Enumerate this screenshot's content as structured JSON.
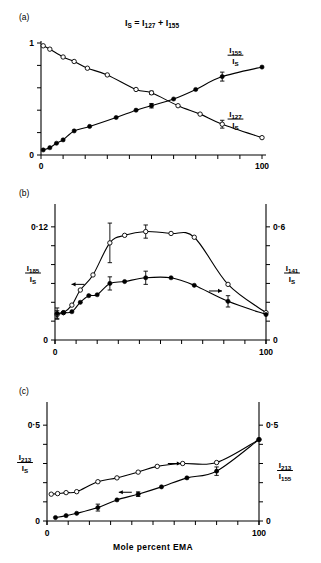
{
  "figure": {
    "title_equation": {
      "parts": [
        {
          "text": "I",
          "sub": "S"
        },
        {
          "text": " = ",
          "sub": ""
        },
        {
          "text": "I",
          "sub": "127"
        },
        {
          "text": " + ",
          "sub": ""
        },
        {
          "text": "I",
          "sub": "155"
        }
      ],
      "plain": "I_S = I_127 + I_155"
    },
    "xlabel": "Mole percent EMA",
    "panels": [
      "(a)",
      "(b)",
      "(c)"
    ]
  },
  "chart_data": [
    {
      "panel": "(a)",
      "type": "scatter",
      "title": "I_S = I_127 + I_155",
      "xlabel": "",
      "ylabel": "",
      "xlim": [
        0,
        100
      ],
      "ylim": [
        0,
        1
      ],
      "xticks": [
        0,
        10,
        20,
        30,
        40,
        50,
        60,
        70,
        80,
        90,
        100
      ],
      "xticklabels": [
        "0",
        "",
        "",
        "",
        "",
        "",
        "",
        "",
        "",
        "",
        "100"
      ],
      "yticks": [
        0,
        0.2,
        0.4,
        0.6,
        0.8,
        1.0
      ],
      "yticklabels": [
        "0",
        "",
        "",
        "",
        "",
        "1"
      ],
      "grid": false,
      "series": [
        {
          "name": "I_155 / I_S",
          "label_num": "155",
          "label_den": "S",
          "marker": "filled-circle",
          "x": [
            1,
            4,
            7,
            10,
            15,
            22,
            34,
            43,
            50,
            60,
            70,
            82,
            100
          ],
          "values": [
            0.045,
            0.065,
            0.105,
            0.135,
            0.215,
            0.255,
            0.335,
            0.4,
            0.44,
            0.5,
            0.585,
            0.7,
            0.785
          ],
          "errors": [
            0,
            0,
            0,
            0,
            0,
            0,
            0,
            0,
            0.02,
            0,
            0,
            0.04,
            0
          ],
          "label_xy": [
            88,
            0.9
          ]
        },
        {
          "name": "I_127 / I_S",
          "label_num": "127",
          "label_den": "S",
          "marker": "open-circle",
          "x": [
            1,
            4,
            10,
            15,
            21,
            30,
            43,
            50,
            62,
            72,
            82,
            100
          ],
          "values": [
            0.975,
            0.945,
            0.875,
            0.835,
            0.775,
            0.715,
            0.585,
            0.555,
            0.44,
            0.365,
            0.275,
            0.155
          ],
          "errors": [
            0,
            0,
            0,
            0,
            0,
            0,
            0,
            0.015,
            0,
            0,
            0.035,
            0
          ],
          "label_xy": [
            88,
            0.33
          ]
        }
      ]
    },
    {
      "panel": "(b)",
      "type": "scatter",
      "xlabel": "",
      "xlim": [
        0,
        100
      ],
      "xticks": [
        0,
        10,
        20,
        30,
        40,
        50,
        60,
        70,
        80,
        90,
        100
      ],
      "xticklabels": [
        "0",
        "",
        "",
        "",
        "",
        "",
        "",
        "",
        "",
        "",
        "100"
      ],
      "left_axis": {
        "label_num": "185",
        "label_den": "S",
        "lim": [
          0,
          0.14
        ],
        "ticks": [
          0,
          0.02,
          0.04,
          0.06,
          0.08,
          0.1,
          0.12
        ],
        "ticklabels": [
          "0",
          "",
          "",
          "",
          "",
          "",
          "0·12"
        ]
      },
      "right_axis": {
        "label_num": "141",
        "label_den": "S",
        "lim": [
          0,
          0.7
        ],
        "ticks": [
          0,
          0.1,
          0.2,
          0.3,
          0.4,
          0.5,
          0.6
        ],
        "ticklabels": [
          "0",
          "",
          "",
          "",
          "",
          "",
          "0·6"
        ]
      },
      "grid": false,
      "series": [
        {
          "name": "I_141 / I_S",
          "axis": "right",
          "marker": "open-circle",
          "arrow": "left",
          "arrow_xy": [
            14,
            0.295
          ],
          "x": [
            1,
            4,
            8,
            12,
            18,
            26,
            33,
            43,
            55,
            66,
            82,
            100
          ],
          "values": [
            0.135,
            0.145,
            0.185,
            0.265,
            0.345,
            0.515,
            0.555,
            0.575,
            0.565,
            0.545,
            0.295,
            0.145
          ],
          "errors": [
            0.02,
            0,
            0,
            0,
            0,
            0.105,
            0,
            0.035,
            0,
            0,
            0,
            0
          ]
        },
        {
          "name": "I_185 / I_S",
          "axis": "left",
          "marker": "filled-circle",
          "arrow": "right",
          "arrow_xy": [
            73,
            0.052
          ],
          "x": [
            1,
            4,
            8,
            12,
            16,
            20,
            26,
            33,
            43,
            55,
            66,
            82,
            100
          ],
          "values": [
            0.028,
            0.029,
            0.03,
            0.04,
            0.047,
            0.048,
            0.06,
            0.062,
            0.066,
            0.066,
            0.058,
            0.041,
            0.027
          ],
          "errors": [
            0.006,
            0,
            0,
            0,
            0,
            0,
            0.007,
            0,
            0.007,
            0,
            0,
            0.006,
            0
          ]
        }
      ]
    },
    {
      "panel": "(c)",
      "type": "scatter",
      "xlabel": "Mole percent EMA",
      "xlim": [
        0,
        100
      ],
      "xticks": [
        0,
        10,
        20,
        30,
        40,
        50,
        60,
        70,
        80,
        90,
        100
      ],
      "xticklabels": [
        "0",
        "",
        "",
        "",
        "",
        "",
        "",
        "",
        "",
        "",
        "100"
      ],
      "left_axis": {
        "label_num": "213",
        "label_den": "S",
        "lim": [
          0,
          0.6
        ],
        "ticks": [
          0,
          0.1,
          0.2,
          0.3,
          0.4,
          0.5
        ],
        "ticklabels": [
          "0",
          "",
          "",
          "",
          "",
          "0·5"
        ]
      },
      "right_axis": {
        "label_num": "213",
        "label_den": "155",
        "lim": [
          0,
          0.6
        ],
        "ticks": [
          0,
          0.1,
          0.2,
          0.3,
          0.4,
          0.5
        ],
        "ticklabels": [
          "0",
          "",
          "",
          "",
          "",
          "0·5"
        ]
      },
      "grid": false,
      "series": [
        {
          "name": "I_213 / I_155",
          "axis": "right",
          "marker": "open-circle",
          "arrow": "right",
          "arrow_xy": [
            57,
            0.3
          ],
          "x": [
            2,
            5,
            9,
            14,
            24,
            33,
            43,
            52,
            64,
            80,
            100
          ],
          "values": [
            0.14,
            0.143,
            0.148,
            0.153,
            0.205,
            0.225,
            0.255,
            0.285,
            0.3,
            0.305,
            0.425
          ],
          "errors": [
            0,
            0,
            0,
            0,
            0,
            0,
            0,
            0,
            0,
            0,
            0
          ]
        },
        {
          "name": "I_213 / I_S",
          "axis": "left",
          "marker": "filled-circle",
          "arrow": "left",
          "arrow_xy": [
            40,
            0.15
          ],
          "x": [
            4,
            9,
            14,
            24,
            33,
            43,
            54,
            66,
            80,
            100
          ],
          "values": [
            0.018,
            0.028,
            0.04,
            0.07,
            0.11,
            0.14,
            0.178,
            0.225,
            0.26,
            0.425
          ],
          "errors": [
            0,
            0,
            0,
            0.018,
            0,
            0.012,
            0,
            0,
            0.022,
            0
          ]
        }
      ]
    }
  ]
}
